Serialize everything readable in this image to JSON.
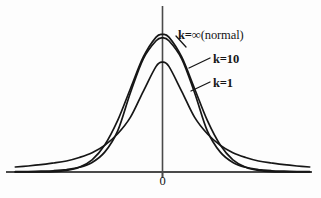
{
  "figure": {
    "background_color": "#fdfdfd",
    "ink_color": "#161616",
    "axis_color": "#4a4a4a"
  },
  "axes": {
    "x_axis_label": "",
    "y_axis_label": "",
    "origin_tick_label": "0"
  },
  "labels": {
    "k_infinity": {
      "prefix": "k=∞",
      "suffix": "(normal)"
    },
    "k_ten": {
      "text": "k=10"
    },
    "k_one": {
      "text": "k=1"
    }
  },
  "chart_data": {
    "type": "line",
    "title": "",
    "subtitle": "",
    "xlabel": "",
    "ylabel": "",
    "xlim": [
      -4.6,
      4.6
    ],
    "ylim": [
      0,
      0.45
    ],
    "grid": false,
    "legend_position": "inline-callout",
    "xticks": [
      0
    ],
    "xticklabels": [
      "0"
    ],
    "yticks": [],
    "yticklabels": [],
    "annotations": [
      {
        "text": "k=∞(normal)",
        "target_series": "k=∞ (normal)",
        "x": 1.1,
        "y": 0.33
      },
      {
        "text": "k=10",
        "target_series": "k=10",
        "x": 1.45,
        "y": 0.255
      },
      {
        "text": "k=1",
        "target_series": "k=1",
        "x": 1.45,
        "y": 0.175
      }
    ],
    "x": [
      -4.6,
      -4.2,
      -3.8,
      -3.4,
      -3.0,
      -2.6,
      -2.2,
      -1.8,
      -1.4,
      -1.0,
      -0.6,
      -0.2,
      0.0,
      0.2,
      0.6,
      1.0,
      1.4,
      1.8,
      2.2,
      2.6,
      3.0,
      3.4,
      3.8,
      4.2,
      4.6
    ],
    "series": [
      {
        "name": "k=∞ (normal)",
        "label": "k=∞(normal)",
        "color": "#161616",
        "peak_value": 0.399,
        "values": [
          0.0,
          0.0001,
          0.0003,
          0.0012,
          0.0044,
          0.0136,
          0.0355,
          0.079,
          0.1497,
          0.242,
          0.3332,
          0.391,
          0.3989,
          0.391,
          0.3332,
          0.242,
          0.1497,
          0.079,
          0.0355,
          0.0136,
          0.0044,
          0.0012,
          0.0003,
          0.0001,
          0.0
        ]
      },
      {
        "name": "k=10",
        "label": "k=10",
        "color": "#161616",
        "peak_value": 0.389,
        "values": [
          0.0008,
          0.0013,
          0.0022,
          0.0039,
          0.0071,
          0.0137,
          0.0278,
          0.0582,
          0.119,
          0.2304,
          0.3282,
          0.3807,
          0.3891,
          0.3807,
          0.3282,
          0.2304,
          0.119,
          0.0582,
          0.0278,
          0.0137,
          0.0071,
          0.0039,
          0.0022,
          0.0013,
          0.0008
        ]
      },
      {
        "name": "k=1",
        "label": "k=1",
        "color": "#161616",
        "peak_value": 0.318,
        "values": [
          0.0146,
          0.0175,
          0.0212,
          0.0262,
          0.0318,
          0.042,
          0.056,
          0.078,
          0.111,
          0.159,
          0.234,
          0.306,
          0.3183,
          0.306,
          0.234,
          0.159,
          0.111,
          0.078,
          0.056,
          0.042,
          0.0318,
          0.0262,
          0.0212,
          0.0175,
          0.0146
        ]
      }
    ]
  }
}
